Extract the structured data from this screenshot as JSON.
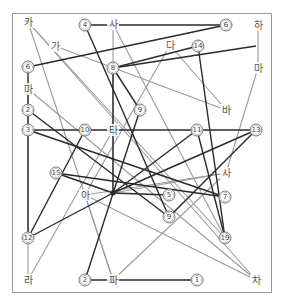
{
  "title": "",
  "colors": {
    "frame": "#9a9a9a",
    "dark_line": "#2a2a2a",
    "gray_line": "#9a9a9a",
    "node_circle": "#777777",
    "background": "#ffffff"
  },
  "number_nodes": [
    {
      "id": "n4",
      "label": "4",
      "x": 85,
      "y": 25
    },
    {
      "id": "n6a",
      "label": "6",
      "x": 226,
      "y": 25
    },
    {
      "id": "n6b",
      "label": "6",
      "x": 28,
      "y": 67
    },
    {
      "id": "n8",
      "label": "8",
      "x": 113,
      "y": 68
    },
    {
      "id": "n14",
      "label": "14",
      "x": 198,
      "y": 46
    },
    {
      "id": "n2a",
      "label": "2",
      "x": 28,
      "y": 110
    },
    {
      "id": "n9a",
      "label": "9",
      "x": 140,
      "y": 110
    },
    {
      "id": "n3",
      "label": "3",
      "x": 28,
      "y": 130
    },
    {
      "id": "n10",
      "label": "10",
      "x": 85,
      "y": 130
    },
    {
      "id": "n11",
      "label": "11",
      "x": 197,
      "y": 130
    },
    {
      "id": "n13",
      "label": "13",
      "x": 256,
      "y": 130
    },
    {
      "id": "n15",
      "label": "15",
      "x": 56,
      "y": 173
    },
    {
      "id": "n5",
      "label": "5",
      "x": 169,
      "y": 195
    },
    {
      "id": "n7",
      "label": "7",
      "x": 225,
      "y": 197
    },
    {
      "id": "n9b",
      "label": "9",
      "x": 169,
      "y": 217
    },
    {
      "id": "n12",
      "label": "12",
      "x": 28,
      "y": 238
    },
    {
      "id": "n19",
      "label": "19",
      "x": 225,
      "y": 238
    },
    {
      "id": "n2b",
      "label": "2",
      "x": 85,
      "y": 280
    },
    {
      "id": "n1",
      "label": "1",
      "x": 197,
      "y": 280
    }
  ],
  "hangul_nodes": [
    {
      "id": "ka",
      "label": "카",
      "x": 28,
      "y": 22
    },
    {
      "id": "sa",
      "label": "사",
      "x": 113,
      "y": 24
    },
    {
      "id": "ha",
      "label": "하",
      "x": 258,
      "y": 25
    },
    {
      "id": "ga",
      "label": "가",
      "x": 55,
      "y": 46
    },
    {
      "id": "da",
      "label": "다",
      "x": 170,
      "y": 45
    },
    {
      "id": "ma_r",
      "label": "마",
      "x": 258,
      "y": 68
    },
    {
      "id": "ma_l",
      "label": "마",
      "x": 28,
      "y": 89
    },
    {
      "id": "ba",
      "label": "바",
      "x": 226,
      "y": 110
    },
    {
      "id": "ta",
      "label": "타",
      "x": 113,
      "y": 130
    },
    {
      "id": "a",
      "label": "아",
      "x": 85,
      "y": 195
    },
    {
      "id": "sa2",
      "label": "사",
      "x": 226,
      "y": 173
    },
    {
      "id": "ra",
      "label": "라",
      "x": 28,
      "y": 280
    },
    {
      "id": "pa",
      "label": "파",
      "x": 113,
      "y": 280
    },
    {
      "id": "cha",
      "label": "차",
      "x": 256,
      "y": 280
    }
  ],
  "hub": {
    "x": 113,
    "y": 193
  },
  "dark_edges": [
    [
      85,
      25,
      226,
      25
    ],
    [
      85,
      25,
      169,
      217
    ],
    [
      226,
      25,
      28,
      67
    ],
    [
      28,
      67,
      28,
      238
    ],
    [
      113,
      68,
      113,
      193
    ],
    [
      113,
      68,
      256,
      46
    ],
    [
      198,
      46,
      225,
      238
    ],
    [
      198,
      46,
      113,
      68
    ],
    [
      28,
      110,
      169,
      217
    ],
    [
      28,
      130,
      256,
      130
    ],
    [
      28,
      130,
      225,
      197
    ],
    [
      85,
      130,
      28,
      238
    ],
    [
      140,
      110,
      85,
      280
    ],
    [
      140,
      110,
      113,
      68
    ],
    [
      56,
      173,
      225,
      197
    ],
    [
      56,
      173,
      113,
      193
    ],
    [
      113,
      193,
      256,
      130
    ],
    [
      113,
      193,
      197,
      130
    ],
    [
      169,
      217,
      256,
      130
    ],
    [
      28,
      238,
      113,
      193
    ],
    [
      197,
      130,
      225,
      238
    ],
    [
      85,
      280,
      197,
      280
    ],
    [
      113,
      193,
      169,
      195
    ]
  ],
  "gray_edges": [
    [
      28,
      22,
      225,
      238
    ],
    [
      28,
      22,
      113,
      280
    ],
    [
      113,
      24,
      225,
      238
    ],
    [
      113,
      24,
      113,
      193
    ],
    [
      55,
      46,
      226,
      110
    ],
    [
      170,
      45,
      226,
      110
    ],
    [
      170,
      45,
      85,
      195
    ],
    [
      258,
      25,
      258,
      68
    ],
    [
      258,
      68,
      226,
      173
    ],
    [
      28,
      89,
      256,
      280
    ],
    [
      28,
      89,
      28,
      280
    ],
    [
      28,
      280,
      113,
      130
    ],
    [
      85,
      195,
      256,
      280
    ],
    [
      113,
      280,
      226,
      173
    ],
    [
      113,
      193,
      226,
      173
    ],
    [
      85,
      195,
      226,
      173
    ],
    [
      113,
      280,
      85,
      195
    ],
    [
      256,
      280,
      28,
      22
    ]
  ]
}
